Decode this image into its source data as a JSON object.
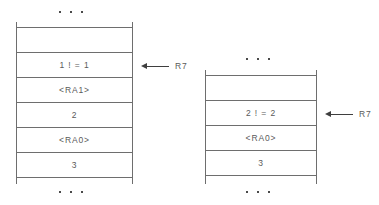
{
  "diagram": {
    "line_color": "#6e6e6e",
    "text_color": "#5a5a5a",
    "arrow_color": "#3f3f3f",
    "background": "#ffffff",
    "ellipsis_glyph": "...",
    "stacks": [
      {
        "id": "left-stack",
        "name": "stack-diagram-left",
        "top_ellipsis": "...",
        "bottom_ellipsis": "...",
        "cells": [
          {
            "name": "cell-empty-top",
            "value": ""
          },
          {
            "name": "cell-factorial-1",
            "value": "1 ! = 1"
          },
          {
            "name": "cell-return-address-1",
            "value": "<RA1>"
          },
          {
            "name": "cell-argument-2",
            "value": "2"
          },
          {
            "name": "cell-return-address-0",
            "value": "<RA0>"
          },
          {
            "name": "cell-argument-3",
            "value": "3"
          }
        ],
        "pointer": {
          "name": "stack-pointer-r7-left",
          "register": "R7",
          "points_at_cell": "cell-factorial-1"
        }
      },
      {
        "id": "right-stack",
        "name": "stack-diagram-right",
        "top_ellipsis": "...",
        "bottom_ellipsis": "...",
        "cells": [
          {
            "name": "cell-empty-top",
            "value": ""
          },
          {
            "name": "cell-factorial-2",
            "value": "2 ! = 2"
          },
          {
            "name": "cell-return-address-0",
            "value": "<RA0>"
          },
          {
            "name": "cell-argument-3",
            "value": "3"
          }
        ],
        "pointer": {
          "name": "stack-pointer-r7-right",
          "register": "R7",
          "points_at_cell": "cell-factorial-2"
        }
      }
    ]
  }
}
